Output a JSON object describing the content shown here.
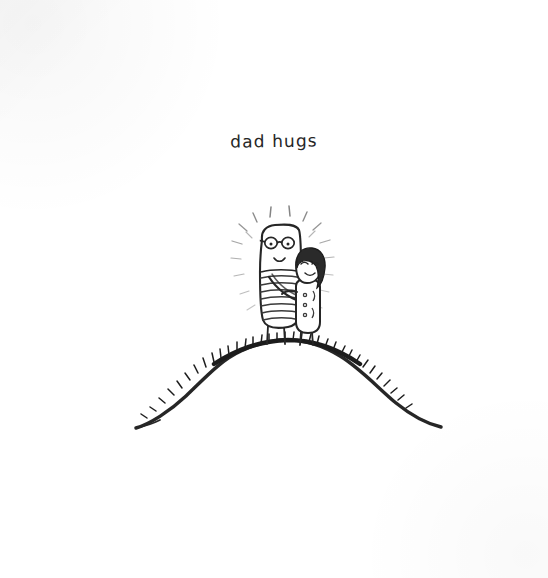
{
  "artwork": {
    "caption": "dad hugs",
    "medium": "pen-and-ink drawing",
    "background_color": "#ffffff",
    "ink_color": "#2a2a2a",
    "canvas": {
      "width": 548,
      "height": 578
    },
    "scene": {
      "ground_label": "grassy hill",
      "figures": [
        {
          "name": "dad",
          "description": "tall rounded figure with round glasses, dot eyes, small smile, horizontally striped shirt, two thin legs",
          "features": [
            "round-glasses",
            "dot-eyes",
            "smile",
            "striped-shirt",
            "hugging-arm",
            "thin-legs"
          ]
        },
        {
          "name": "child",
          "description": "shorter figure with dark bobbed hair, closed happy eyes, tunic with small buttons, leaning into the hug",
          "features": [
            "dark-hair",
            "closed-eyes",
            "smile",
            "tunic",
            "buttons",
            "thin-legs"
          ]
        }
      ],
      "glow": {
        "label": "radiating glow dashes",
        "dash_count": 18
      },
      "grass": {
        "label": "grass tufts along hilltop",
        "tuft_count": 34
      }
    }
  }
}
